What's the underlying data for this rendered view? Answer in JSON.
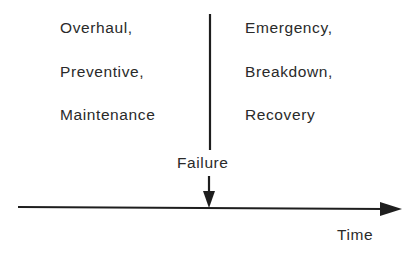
{
  "diagram": {
    "left_group": {
      "lines": [
        "Overhaul,",
        "Preventive,",
        "Maintenance"
      ]
    },
    "right_group": {
      "lines": [
        "Emergency,",
        "Breakdown,",
        "Recovery"
      ]
    },
    "event_label": "Failure",
    "axis_label": "Time",
    "colors": {
      "line": "#1e1e1e",
      "text": "#2a2a2a",
      "background": "#ffffff"
    }
  }
}
